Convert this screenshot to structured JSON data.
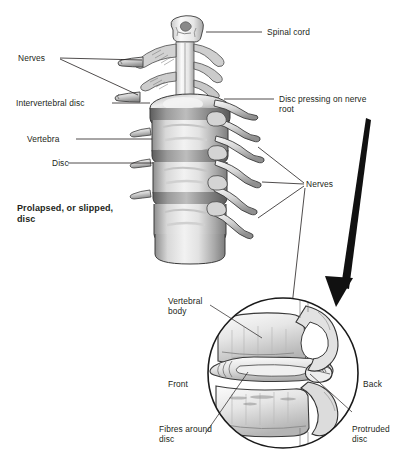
{
  "figure": {
    "background_color": "#ffffff",
    "ink_color": "#231f20",
    "caption": {
      "line1": "Prolapsed, or slipped,",
      "line2": "disc"
    },
    "main_view": {
      "name": "cervical-spine-column",
      "description": "Grayscale anatomical drawing of stacked vertebrae with intervertebral discs and nerve roots branching to the right, spinal cord visible at top"
    },
    "inset_view": {
      "name": "magnified-disc-detail",
      "description": "Circular magnified cross-section of two vertebral bodies with a protruded disc pressing backwards",
      "diameter_px": 150
    },
    "labels": {
      "spinal_cord": "Spinal cord",
      "disc_pressing": {
        "line1": "Disc pressing on nerve",
        "line2": "root"
      },
      "nerves_left": "Nerves",
      "intervertebral_disc": "Intervertebral disc",
      "vertebra": "Vertebra",
      "disc": "Disc",
      "nerves_right": "Nerves",
      "vertebral_body": {
        "line1": "Vertebral",
        "line2": "body"
      },
      "front": "Front",
      "back": "Back",
      "fibres_around_disc": {
        "line1": "Fibres around",
        "line2": "disc"
      },
      "protruded_disc": {
        "line1": "Protruded",
        "line2": "disc"
      }
    }
  }
}
